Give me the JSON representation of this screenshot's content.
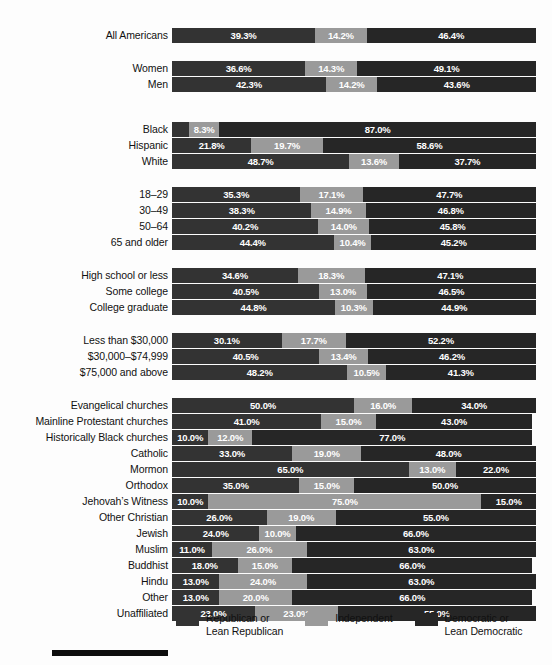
{
  "chart_data": {
    "type": "bar",
    "subtype": "stacked-horizontal-100",
    "title": "",
    "xlabel": "",
    "ylabel": "",
    "xlim": [
      0,
      100
    ],
    "grid": false,
    "legend_position": "bottom",
    "series": [
      {
        "name": "Republican or Lean Republican",
        "color": "#333333",
        "key": "rep"
      },
      {
        "name": "Independent",
        "color": "#9a9a9a",
        "key": "ind"
      },
      {
        "name": "Democratic or Lean Democratic",
        "color": "#262626",
        "key": "dem"
      }
    ],
    "groups": [
      {
        "name": "overall",
        "rows": [
          {
            "label": "All Americans",
            "rep": 39.3,
            "ind": 14.2,
            "dem": 46.4,
            "rep_label": "39.3%",
            "ind_label": "14.2%",
            "dem_label": "46.4%"
          }
        ]
      },
      {
        "name": "gender",
        "rows": [
          {
            "label": "Women",
            "rep": 36.6,
            "ind": 14.3,
            "dem": 49.1,
            "rep_label": "36.6%",
            "ind_label": "14.3%",
            "dem_label": "49.1%"
          },
          {
            "label": "Men",
            "rep": 42.3,
            "ind": 14.2,
            "dem": 43.6,
            "rep_label": "42.3%",
            "ind_label": "14.2%",
            "dem_label": "43.6%"
          }
        ]
      },
      {
        "name": "race",
        "rows": [
          {
            "label": "Black",
            "rep": 4.7,
            "ind": 8.3,
            "dem": 87.0,
            "rep_label": "4.7%",
            "ind_label": "8.3%",
            "dem_label": "87.0%",
            "rep_label_floats": true
          },
          {
            "label": "Hispanic",
            "rep": 21.8,
            "ind": 19.7,
            "dem": 58.6,
            "rep_label": "21.8%",
            "ind_label": "19.7%",
            "dem_label": "58.6%"
          },
          {
            "label": "White",
            "rep": 48.7,
            "ind": 13.6,
            "dem": 37.7,
            "rep_label": "48.7%",
            "ind_label": "13.6%",
            "dem_label": "37.7%"
          }
        ]
      },
      {
        "name": "age",
        "rows": [
          {
            "label": "18–29",
            "rep": 35.3,
            "ind": 17.1,
            "dem": 47.7,
            "rep_label": "35.3%",
            "ind_label": "17.1%",
            "dem_label": "47.7%"
          },
          {
            "label": "30–49",
            "rep": 38.3,
            "ind": 14.9,
            "dem": 46.8,
            "rep_label": "38.3%",
            "ind_label": "14.9%",
            "dem_label": "46.8%"
          },
          {
            "label": "50–64",
            "rep": 40.2,
            "ind": 14.0,
            "dem": 45.8,
            "rep_label": "40.2%",
            "ind_label": "14.0%",
            "dem_label": "45.8%"
          },
          {
            "label": "65 and older",
            "rep": 44.4,
            "ind": 10.4,
            "dem": 45.2,
            "rep_label": "44.4%",
            "ind_label": "10.4%",
            "dem_label": "45.2%"
          }
        ]
      },
      {
        "name": "education",
        "rows": [
          {
            "label": "High school or less",
            "rep": 34.6,
            "ind": 18.3,
            "dem": 47.1,
            "rep_label": "34.6%",
            "ind_label": "18.3%",
            "dem_label": "47.1%"
          },
          {
            "label": "Some college",
            "rep": 40.5,
            "ind": 13.0,
            "dem": 46.5,
            "rep_label": "40.5%",
            "ind_label": "13.0%",
            "dem_label": "46.5%"
          },
          {
            "label": "College graduate",
            "rep": 44.8,
            "ind": 10.3,
            "dem": 44.9,
            "rep_label": "44.8%",
            "ind_label": "10.3%",
            "dem_label": "44.9%"
          }
        ]
      },
      {
        "name": "income",
        "rows": [
          {
            "label": "Less than $30,000",
            "rep": 30.1,
            "ind": 17.7,
            "dem": 52.2,
            "rep_label": "30.1%",
            "ind_label": "17.7%",
            "dem_label": "52.2%"
          },
          {
            "label": "$30,000–$74,999",
            "rep": 40.5,
            "ind": 13.4,
            "dem": 46.2,
            "rep_label": "40.5%",
            "ind_label": "13.4%",
            "dem_label": "46.2%"
          },
          {
            "label": "$75,000 and above",
            "rep": 48.2,
            "ind": 10.5,
            "dem": 41.3,
            "rep_label": "48.2%",
            "ind_label": "10.5%",
            "dem_label": "41.3%"
          }
        ]
      },
      {
        "name": "religion",
        "rows": [
          {
            "label": "Evangelical churches",
            "rep": 50.0,
            "ind": 16.0,
            "dem": 34.0,
            "rep_label": "50.0%",
            "ind_label": "16.0%",
            "dem_label": "34.0%"
          },
          {
            "label": "Mainline Protestant churches",
            "rep": 41.0,
            "ind": 15.0,
            "dem": 43.0,
            "rep_label": "41.0%",
            "ind_label": "15.0%",
            "dem_label": "43.0%"
          },
          {
            "label": "Historically Black churches",
            "rep": 10.0,
            "ind": 12.0,
            "dem": 77.0,
            "rep_label": "10.0%",
            "ind_label": "12.0%",
            "dem_label": "77.0%"
          },
          {
            "label": "Catholic",
            "rep": 33.0,
            "ind": 19.0,
            "dem": 48.0,
            "rep_label": "33.0%",
            "ind_label": "19.0%",
            "dem_label": "48.0%"
          },
          {
            "label": "Mormon",
            "rep": 65.0,
            "ind": 13.0,
            "dem": 22.0,
            "rep_label": "65.0%",
            "ind_label": "13.0%",
            "dem_label": "22.0%"
          },
          {
            "label": "Orthodox",
            "rep": 35.0,
            "ind": 15.0,
            "dem": 50.0,
            "rep_label": "35.0%",
            "ind_label": "15.0%",
            "dem_label": "50.0%"
          },
          {
            "label": "Jehovah’s Witness",
            "rep": 10.0,
            "ind": 75.0,
            "dem": 15.0,
            "rep_label": "10.0%",
            "ind_label": "75.0%",
            "dem_label": "15.0%"
          },
          {
            "label": "Other Christian",
            "rep": 26.0,
            "ind": 19.0,
            "dem": 55.0,
            "rep_label": "26.0%",
            "ind_label": "19.0%",
            "dem_label": "55.0%"
          },
          {
            "label": "Jewish",
            "rep": 24.0,
            "ind": 10.0,
            "dem": 66.0,
            "rep_label": "24.0%",
            "ind_label": "10.0%",
            "dem_label": "66.0%"
          },
          {
            "label": "Muslim",
            "rep": 11.0,
            "ind": 26.0,
            "dem": 63.0,
            "rep_label": "11.0%",
            "ind_label": "26.0%",
            "dem_label": "63.0%"
          },
          {
            "label": "Buddhist",
            "rep": 18.0,
            "ind": 15.0,
            "dem": 66.0,
            "rep_label": "18.0%",
            "ind_label": "15.0%",
            "dem_label": "66.0%"
          },
          {
            "label": "Hindu",
            "rep": 13.0,
            "ind": 24.0,
            "dem": 63.0,
            "rep_label": "13.0%",
            "ind_label": "24.0%",
            "dem_label": "63.0%"
          },
          {
            "label": "Other",
            "rep": 13.0,
            "ind": 20.0,
            "dem": 66.0,
            "rep_label": "13.0%",
            "ind_label": "20.0%",
            "dem_label": "66.0%"
          },
          {
            "label": "Unaffiliated",
            "rep": 23.0,
            "ind": 23.0,
            "dem": 55.0,
            "rep_label": "23.0%",
            "ind_label": "23.0%",
            "dem_label": "55.0%"
          }
        ]
      }
    ]
  },
  "legend": {
    "items": [
      {
        "label": "Republican or\nLean Republican",
        "color": "#333333"
      },
      {
        "label": "Independent",
        "color": "#9a9a9a"
      },
      {
        "label": "Democratic or\nLean Democratic",
        "color": "#262626"
      }
    ]
  },
  "colors": {
    "republican": "#333333",
    "independent": "#9a9a9a",
    "democratic": "#262626",
    "background": "#fdfdfd",
    "text": "#111111",
    "footer_rule": "#0d0d0d"
  }
}
